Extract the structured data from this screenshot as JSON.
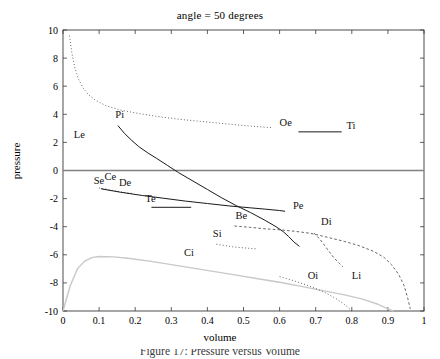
{
  "figure": {
    "title": "angle = 50 degrees",
    "caption": "Figure 17: Pressure versus Volume"
  },
  "chart_data": {
    "type": "line",
    "title": "angle = 50 degrees",
    "xlabel": "volume",
    "ylabel": "pressure",
    "xlim": [
      0,
      1
    ],
    "ylim": [
      -10,
      10
    ],
    "xticks": [
      "0",
      "0.1",
      "0.2",
      "0.3",
      "0.4",
      "0.5",
      "0.6",
      "0.7",
      "0.8",
      "0.9",
      "1"
    ],
    "xtick_values": [
      0,
      0.1,
      0.2,
      0.3,
      0.4,
      0.5,
      0.6,
      0.7,
      0.8,
      0.9,
      1
    ],
    "yticks": [
      "10",
      "8",
      "6",
      "4",
      "2",
      "0",
      "-2",
      "-4",
      "-6",
      "-8",
      "-10"
    ],
    "ytick_values": [
      10,
      8,
      6,
      4,
      2,
      0,
      -2,
      -4,
      -6,
      -8,
      -10
    ],
    "grid": false,
    "legend": "inline-annotations",
    "zero_line": {
      "y": 0,
      "color": "#808080"
    },
    "series": [
      {
        "name": "Le",
        "style": "dotted",
        "color": "#555555",
        "label": {
          "x": 0.03,
          "y": 2.3
        },
        "points": [
          [
            0.018,
            9.6
          ],
          [
            0.025,
            8.3
          ],
          [
            0.033,
            7.3
          ],
          [
            0.043,
            6.5
          ],
          [
            0.055,
            5.9
          ],
          [
            0.07,
            5.4
          ],
          [
            0.09,
            5.0
          ],
          [
            0.12,
            4.6
          ],
          [
            0.16,
            4.3
          ],
          [
            0.2,
            4.1
          ],
          [
            0.26,
            3.85
          ],
          [
            0.32,
            3.65
          ],
          [
            0.38,
            3.5
          ],
          [
            0.44,
            3.35
          ],
          [
            0.5,
            3.2
          ],
          [
            0.55,
            3.1
          ],
          [
            0.58,
            3.05
          ]
        ]
      },
      {
        "name": "Oe",
        "style": "dotted-end-label",
        "color": "#555555",
        "label": {
          "x": 0.6,
          "y": 3.2
        },
        "points": []
      },
      {
        "name": "Pi",
        "style": "solid",
        "color": "#1a1a1a",
        "label": {
          "x": 0.145,
          "y": 3.75
        },
        "points": [
          [
            0.152,
            3.2
          ],
          [
            0.17,
            2.65
          ],
          [
            0.19,
            2.15
          ],
          [
            0.21,
            1.7
          ],
          [
            0.235,
            1.25
          ],
          [
            0.26,
            0.85
          ],
          [
            0.29,
            0.35
          ],
          [
            0.32,
            -0.15
          ],
          [
            0.36,
            -0.75
          ],
          [
            0.4,
            -1.35
          ],
          [
            0.44,
            -1.95
          ],
          [
            0.48,
            -2.5
          ],
          [
            0.52,
            -3.0
          ],
          [
            0.56,
            -3.55
          ],
          [
            0.59,
            -4.0
          ],
          [
            0.61,
            -4.35
          ],
          [
            0.625,
            -4.7
          ],
          [
            0.64,
            -5.1
          ],
          [
            0.655,
            -5.4
          ]
        ]
      },
      {
        "name": "Ti",
        "style": "solid-segment",
        "color": "#1a1a1a",
        "label": {
          "x": 0.785,
          "y": 2.95
        },
        "points": [
          [
            0.652,
            2.75
          ],
          [
            0.772,
            2.75
          ]
        ]
      },
      {
        "name": "Se",
        "style": "label-only",
        "color": "#555555",
        "label": {
          "x": 0.085,
          "y": -0.95
        },
        "points": []
      },
      {
        "name": "Ce",
        "style": "dotted",
        "color": "#555555",
        "label": {
          "x": 0.115,
          "y": -0.7
        },
        "points": [
          [
            0.1,
            -1.25
          ],
          [
            0.115,
            -1.3
          ],
          [
            0.13,
            -1.38
          ],
          [
            0.145,
            -1.45
          ],
          [
            0.16,
            -1.52
          ],
          [
            0.175,
            -1.58
          ],
          [
            0.19,
            -1.62
          ]
        ]
      },
      {
        "name": "De",
        "style": "solid",
        "color": "#1a1a1a",
        "label": {
          "x": 0.155,
          "y": -1.12
        },
        "points": [
          [
            0.105,
            -1.3
          ],
          [
            0.16,
            -1.55
          ],
          [
            0.22,
            -1.78
          ],
          [
            0.28,
            -1.98
          ],
          [
            0.34,
            -2.18
          ],
          [
            0.4,
            -2.35
          ],
          [
            0.46,
            -2.52
          ],
          [
            0.52,
            -2.66
          ],
          [
            0.56,
            -2.75
          ],
          [
            0.6,
            -2.85
          ],
          [
            0.615,
            -2.9
          ]
        ]
      },
      {
        "name": "Te",
        "style": "solid-segment",
        "color": "#1a1a1a",
        "label": {
          "x": 0.228,
          "y": -2.25
        },
        "points": [
          [
            0.245,
            -2.62
          ],
          [
            0.355,
            -2.62
          ]
        ]
      },
      {
        "name": "Pe",
        "style": "label-only",
        "color": "#1a1a1a",
        "label": {
          "x": 0.637,
          "y": -2.75
        },
        "points": []
      },
      {
        "name": "Be",
        "style": "dashed",
        "color": "#555555",
        "label": {
          "x": 0.478,
          "y": -3.45
        },
        "points": [
          [
            0.475,
            -3.95
          ],
          [
            0.52,
            -4.05
          ],
          [
            0.56,
            -4.15
          ],
          [
            0.6,
            -4.22
          ],
          [
            0.64,
            -4.32
          ],
          [
            0.68,
            -4.45
          ],
          [
            0.7,
            -4.55
          ],
          [
            0.74,
            -4.8
          ],
          [
            0.78,
            -5.05
          ],
          [
            0.82,
            -5.35
          ],
          [
            0.86,
            -5.75
          ],
          [
            0.89,
            -6.2
          ],
          [
            0.91,
            -6.7
          ],
          [
            0.93,
            -7.4
          ],
          [
            0.945,
            -8.2
          ],
          [
            0.955,
            -9.1
          ],
          [
            0.962,
            -9.85
          ]
        ]
      },
      {
        "name": "Di",
        "style": "dashed-branch",
        "color": "#555555",
        "label": {
          "x": 0.715,
          "y": -3.85
        },
        "points": [
          [
            0.695,
            -4.45
          ],
          [
            0.712,
            -4.9
          ],
          [
            0.725,
            -5.35
          ],
          [
            0.738,
            -5.8
          ],
          [
            0.75,
            -6.2
          ],
          [
            0.765,
            -6.6
          ],
          [
            0.775,
            -6.85
          ]
        ]
      },
      {
        "name": "Si",
        "style": "dotted",
        "color": "#555555",
        "label": {
          "x": 0.415,
          "y": -4.75
        },
        "points": [
          [
            0.425,
            -5.25
          ],
          [
            0.45,
            -5.35
          ],
          [
            0.475,
            -5.45
          ],
          [
            0.5,
            -5.5
          ],
          [
            0.52,
            -5.55
          ],
          [
            0.535,
            -5.58
          ]
        ]
      },
      {
        "name": "Ci",
        "style": "solid-light",
        "color": "#c8c8c8",
        "label": {
          "x": 0.335,
          "y": -6.05
        },
        "points": [
          [
            0.0,
            -10.0
          ],
          [
            0.02,
            -8.2
          ],
          [
            0.04,
            -7.0
          ],
          [
            0.06,
            -6.45
          ],
          [
            0.08,
            -6.2
          ],
          [
            0.1,
            -6.12
          ],
          [
            0.14,
            -6.15
          ],
          [
            0.18,
            -6.25
          ],
          [
            0.24,
            -6.45
          ],
          [
            0.3,
            -6.7
          ],
          [
            0.36,
            -6.95
          ],
          [
            0.42,
            -7.2
          ],
          [
            0.48,
            -7.45
          ],
          [
            0.54,
            -7.7
          ],
          [
            0.6,
            -7.95
          ],
          [
            0.66,
            -8.25
          ],
          [
            0.72,
            -8.55
          ],
          [
            0.78,
            -8.85
          ],
          [
            0.83,
            -9.15
          ],
          [
            0.87,
            -9.5
          ],
          [
            0.9,
            -9.85
          ],
          [
            0.915,
            -10.0
          ]
        ]
      },
      {
        "name": "Oi",
        "style": "dotted",
        "color": "#555555",
        "label": {
          "x": 0.678,
          "y": -7.75
        },
        "points": [
          [
            0.6,
            -7.55
          ],
          [
            0.64,
            -7.85
          ],
          [
            0.675,
            -8.15
          ],
          [
            0.705,
            -8.45
          ],
          [
            0.73,
            -8.75
          ],
          [
            0.755,
            -9.1
          ],
          [
            0.775,
            -9.45
          ],
          [
            0.79,
            -9.75
          ],
          [
            0.8,
            -10.0
          ]
        ]
      },
      {
        "name": "Li",
        "style": "label-only",
        "color": "#555555",
        "label": {
          "x": 0.8,
          "y": -7.75
        },
        "points": []
      }
    ]
  }
}
